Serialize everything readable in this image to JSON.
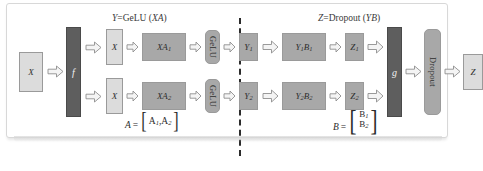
{
  "diagram": {
    "titles": {
      "left_var": "Y",
      "left_eq": "=GeLU (",
      "left_arg": "XA",
      "left_close": ")",
      "right_var": "Z",
      "right_eq": "=Dropout (",
      "right_arg": "YB",
      "right_close": ")"
    },
    "nodes": {
      "input_x": "X",
      "split_f": "f",
      "x_top": "X",
      "x_bottom": "X",
      "xa1": "XA",
      "xa1_sub": "1",
      "xa2": "XA",
      "xa2_sub": "2",
      "gelu_top": "GeLU",
      "gelu_bottom": "GeLU",
      "y1": "Y",
      "y1_sub": "1",
      "y2": "Y",
      "y2_sub": "2",
      "y1b1": "Y",
      "y1b1_sub1": "1",
      "y1b1_b": "B",
      "y1b1_sub2": "1",
      "y2b2": "Y",
      "y2b2_sub1": "2",
      "y2b2_b": "B",
      "y2b2_sub2": "2",
      "z1": "Z",
      "z1_sub": "1",
      "z2": "Z",
      "z2_sub": "2",
      "reduce_g": "g",
      "dropout": "Dropout",
      "output_z": "Z"
    },
    "formulas": {
      "a_lhs": "A",
      "a_eq": "=",
      "a_open": "[",
      "a_e1": "A",
      "a_e1_sub": "1",
      "a_comma": ",",
      "a_e2": "A",
      "a_e2_sub": "2",
      "a_close": "]",
      "b_lhs": "B",
      "b_eq": "=",
      "b_open": "[",
      "b_e1": "B",
      "b_e1_sub": "1",
      "b_e2": "B",
      "b_e2_sub": "2",
      "b_close": "]"
    },
    "colors": {
      "light_gray": "#dcdcdc",
      "mid_gray": "#a8a8a8",
      "dark_gray": "#5e5e5e",
      "arrow_fill": "#f4f4f4",
      "arrow_stroke": "#8f8f8f",
      "divider": "#2b2b2b"
    }
  }
}
